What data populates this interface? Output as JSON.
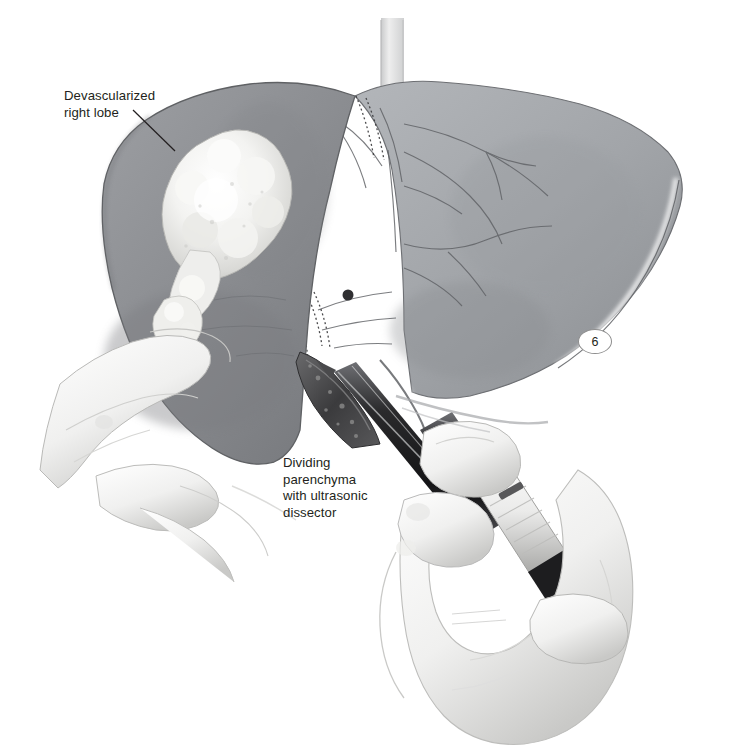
{
  "figure": {
    "domain": "medical-surgical-illustration",
    "number": "6",
    "background_color": "#ffffff",
    "ink_color": "#231f20"
  },
  "annotations": [
    {
      "id": "devascularized-right-lobe",
      "text": "Devascularized\nright lobe",
      "lines": [
        "Devascularized",
        "right lobe"
      ],
      "x": 64,
      "y": 88,
      "leader": {
        "x1": 133,
        "y1": 110,
        "x2": 175,
        "y2": 151
      }
    },
    {
      "id": "dividing-parenchyma",
      "text": "Dividing\nparenchyma\nwith ultrasonic\ndissector",
      "lines": [
        "Dividing",
        "parenchyma",
        "with ultrasonic",
        "dissector"
      ],
      "x": 283,
      "y": 455,
      "leader": null
    }
  ],
  "scene": {
    "structures": [
      {
        "name": "right-hepatic-lobe",
        "tone": "#8e9094",
        "note": "devascularized, darker gray, left of illustration"
      },
      {
        "name": "left-hepatic-lobe",
        "tone": "#a5a8ac",
        "note": "lighter gray with vascular tracery"
      },
      {
        "name": "tumor-mass",
        "tone": "#f2f2f0",
        "note": "bright irregular nodular metastasis on right lobe"
      },
      {
        "name": "satellite-nodule",
        "tone": "#ececeb",
        "note": "smaller inferior tumor nodule"
      },
      {
        "name": "inferior-vena-cava",
        "tone": "#d8d9da",
        "note": "pale vertical vessel at superior midline"
      },
      {
        "name": "transection-surface",
        "tone": "#4a4a4c",
        "note": "mottled dark cut parenchyma"
      },
      {
        "name": "retracting-hand",
        "tone": "#f4f4f3",
        "note": "gloved fingers retracting inferior liver edge"
      },
      {
        "name": "operating-hand",
        "tone": "#f4f4f3",
        "note": "gloved hand gripping dissector handpiece"
      },
      {
        "name": "ultrasonic-dissector",
        "tone": "#2b2b2d",
        "note": "dark shaft, metallic collar, white ribbed grip"
      },
      {
        "name": "vascular-clips",
        "tone": "#3a3a3c",
        "note": "stapled / clipped pedicle lines"
      }
    ]
  }
}
